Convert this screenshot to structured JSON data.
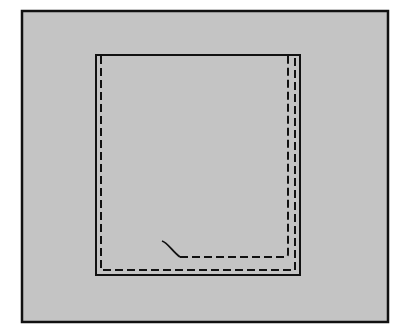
{
  "figure": {
    "background": "#ffffff",
    "panel_fill": "#c4c4c4",
    "stroke": "#111111",
    "outer_frame": {
      "x": 22,
      "y": 11,
      "w": 366,
      "h": 311
    },
    "inner_square": {
      "x": 96,
      "y": 55,
      "w": 204,
      "h": 220
    },
    "dashed_outer_path": "M 101 56 L 101 270 L 295 270 L 295 56",
    "dashed_inner_path": "M 180 257 L 285 257 Q 287 257 287 254 L 287 56",
    "curve_tail_path": "M 162 241 C 168 243 172 251 180 257"
  }
}
